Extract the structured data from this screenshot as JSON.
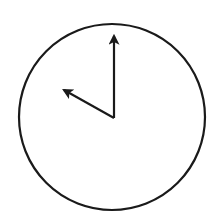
{
  "diagram": {
    "type": "analog-clock",
    "time_shown": "10:00",
    "colors": {
      "background": "#ffffff",
      "stroke": "#1a1a1a"
    },
    "face": {
      "cx": 112,
      "cy": 117,
      "r": 93,
      "stroke_width": 2.2
    },
    "hands": [
      {
        "name": "minute-hand",
        "points_to": 12,
        "x1": 114,
        "y1": 118,
        "x2": 114,
        "y2": 30
      },
      {
        "name": "hour-hand",
        "points_to": 10,
        "x1": 114,
        "y1": 118,
        "x2": 59,
        "y2": 87
      }
    ]
  }
}
